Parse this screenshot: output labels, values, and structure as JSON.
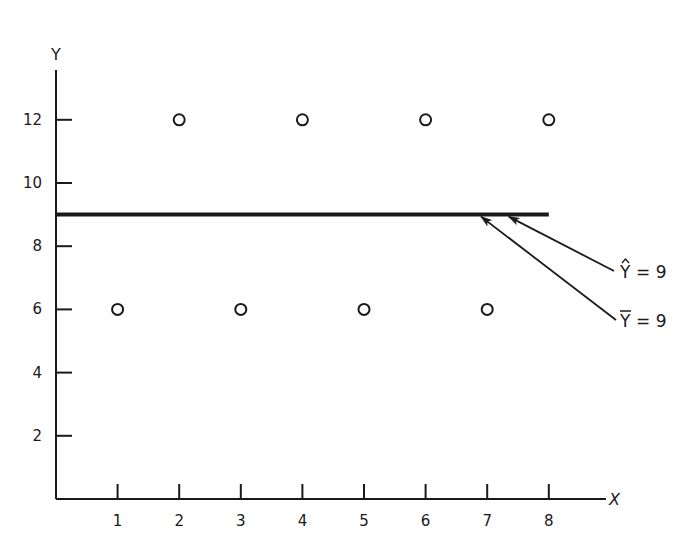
{
  "chart_data": {
    "type": "scatter",
    "title": "",
    "xlabel": "X",
    "ylabel": "Y",
    "xlim": [
      0,
      9
    ],
    "ylim": [
      0,
      13.5
    ],
    "grid": false,
    "x_ticks": [
      1,
      2,
      3,
      4,
      5,
      6,
      7,
      8
    ],
    "y_ticks": [
      2,
      4,
      6,
      8,
      10,
      12
    ],
    "x_tick_labels": [
      "1",
      "2",
      "3",
      "4",
      "5",
      "6",
      "7",
      "8"
    ],
    "y_tick_labels": [
      "2",
      "4",
      "6",
      "8",
      "10",
      "12"
    ],
    "series": [
      {
        "name": "observations",
        "marker": "open-circle",
        "x": [
          1,
          2,
          3,
          4,
          5,
          6,
          7,
          8
        ],
        "y": [
          6,
          12,
          6,
          12,
          6,
          12,
          6,
          12
        ]
      }
    ],
    "lines": [
      {
        "name": "fitted-line",
        "y": 9,
        "x_range": [
          0,
          8
        ]
      }
    ],
    "annotations": [
      {
        "text_symbol": "Y",
        "accent": "hat",
        "text": "= 9",
        "points_to": {
          "x": 7.35,
          "y": 9
        }
      },
      {
        "text_symbol": "Y",
        "accent": "bar",
        "text": "= 9",
        "points_to": {
          "x": 6.9,
          "y": 9
        }
      }
    ]
  }
}
